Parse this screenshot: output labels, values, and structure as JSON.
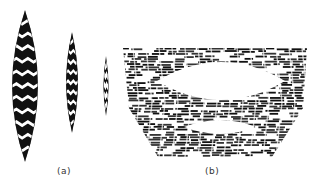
{
  "figure": {
    "panel_a": {
      "label": "(a)",
      "spindles": [
        {
          "cx": 25,
          "top": 10,
          "bottom": 162,
          "half_width": 13,
          "stripes": 11
        },
        {
          "cx": 72,
          "top": 32,
          "bottom": 133,
          "half_width": 6,
          "stripes": 9
        },
        {
          "cx": 106,
          "top": 56,
          "bottom": 116,
          "half_width": 2.6,
          "stripes": 5
        }
      ]
    },
    "panel_b": {
      "label": "(b)",
      "block": {
        "top": 48,
        "bottom": 157,
        "top_left": 123,
        "top_right": 307,
        "bottom_left": 158,
        "bottom_right": 272
      },
      "voids": [
        {
          "x1": 157,
          "x2": 285,
          "cy": 81,
          "half_height": 19
        },
        {
          "x1": 184,
          "x2": 256,
          "cy": 127,
          "half_height": 7
        }
      ]
    },
    "colors": {
      "ink": "#111111",
      "paper": "#ffffff"
    }
  }
}
